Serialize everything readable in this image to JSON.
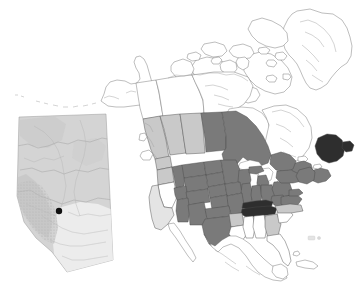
{
  "figure": {
    "width": 364,
    "height": 301,
    "background_color": "#ffffff"
  },
  "legend_colors": {
    "highlight_dark": "#7a7a7a",
    "highlight_darkest": "#2e2e2e",
    "highlight_light": "#c9c9c9",
    "highlight_very_light": "#e2e2e2",
    "unshaded": "#ffffff",
    "border": "#4a4a4a",
    "marker": "#111111"
  },
  "main_map": {
    "name": "north-america-choropleth",
    "projection_note": "Lambert conformal style, North America",
    "shade_classes": [
      {
        "key": "darkest",
        "color": "#2e2e2e",
        "label": "darkest shading"
      },
      {
        "key": "dark",
        "color": "#7a7a7a",
        "label": "dark shading"
      },
      {
        "key": "light",
        "color": "#c9c9c9",
        "label": "light shading"
      },
      {
        "key": "very_light",
        "color": "#e4e4e4",
        "label": "very light shading"
      },
      {
        "key": "none",
        "color": "#ffffff",
        "label": "no shading"
      }
    ],
    "regions": [
      {
        "name": "alaska",
        "shade": "none"
      },
      {
        "name": "yukon",
        "shade": "none"
      },
      {
        "name": "northwest-territories",
        "shade": "none"
      },
      {
        "name": "nunavut",
        "shade": "none"
      },
      {
        "name": "greenland",
        "shade": "none"
      },
      {
        "name": "british-columbia",
        "shade": "light"
      },
      {
        "name": "alberta",
        "shade": "light"
      },
      {
        "name": "saskatchewan",
        "shade": "light"
      },
      {
        "name": "manitoba",
        "shade": "dark"
      },
      {
        "name": "ontario",
        "shade": "dark"
      },
      {
        "name": "quebec",
        "shade": "none"
      },
      {
        "name": "newfoundland-labrador",
        "shade": "darkest"
      },
      {
        "name": "new-brunswick",
        "shade": "dark"
      },
      {
        "name": "nova-scotia",
        "shade": "dark"
      },
      {
        "name": "washington",
        "shade": "light"
      },
      {
        "name": "oregon",
        "shade": "light"
      },
      {
        "name": "idaho",
        "shade": "dark"
      },
      {
        "name": "montana",
        "shade": "dark"
      },
      {
        "name": "north-dakota",
        "shade": "dark"
      },
      {
        "name": "south-dakota",
        "shade": "dark"
      },
      {
        "name": "minnesota",
        "shade": "dark"
      },
      {
        "name": "wisconsin",
        "shade": "dark"
      },
      {
        "name": "michigan",
        "shade": "dark"
      },
      {
        "name": "wyoming",
        "shade": "dark"
      },
      {
        "name": "nebraska",
        "shade": "dark"
      },
      {
        "name": "iowa",
        "shade": "dark"
      },
      {
        "name": "illinois",
        "shade": "dark"
      },
      {
        "name": "indiana",
        "shade": "dark"
      },
      {
        "name": "ohio",
        "shade": "dark"
      },
      {
        "name": "pennsylvania",
        "shade": "dark"
      },
      {
        "name": "new-york",
        "shade": "dark"
      },
      {
        "name": "new-england",
        "shade": "dark"
      },
      {
        "name": "utah",
        "shade": "dark"
      },
      {
        "name": "colorado",
        "shade": "dark"
      },
      {
        "name": "kansas",
        "shade": "dark"
      },
      {
        "name": "missouri",
        "shade": "dark"
      },
      {
        "name": "kentucky",
        "shade": "darkest"
      },
      {
        "name": "tennessee",
        "shade": "darkest"
      },
      {
        "name": "west-virginia",
        "shade": "dark"
      },
      {
        "name": "virginia",
        "shade": "dark"
      },
      {
        "name": "maryland",
        "shade": "dark"
      },
      {
        "name": "nevada",
        "shade": "none"
      },
      {
        "name": "california",
        "shade": "very_light"
      },
      {
        "name": "arizona",
        "shade": "dark"
      },
      {
        "name": "new-mexico",
        "shade": "dark"
      },
      {
        "name": "oklahoma",
        "shade": "dark"
      },
      {
        "name": "texas",
        "shade": "dark"
      },
      {
        "name": "arkansas",
        "shade": "light"
      },
      {
        "name": "louisiana",
        "shade": "none"
      },
      {
        "name": "mississippi",
        "shade": "none"
      },
      {
        "name": "alabama",
        "shade": "none"
      },
      {
        "name": "georgia",
        "shade": "light"
      },
      {
        "name": "south-carolina",
        "shade": "none"
      },
      {
        "name": "north-carolina",
        "shade": "light"
      },
      {
        "name": "florida",
        "shade": "none"
      },
      {
        "name": "mexico",
        "shade": "none"
      },
      {
        "name": "cuba",
        "shade": "none"
      },
      {
        "name": "bermuda-islet",
        "shade": "very_light"
      }
    ]
  },
  "inset_map": {
    "name": "alberta-inset",
    "region_label": "Alberta",
    "fill_color": "#d4d4d4",
    "border_color": "#9a9a9a",
    "marker": {
      "name": "study-site-marker",
      "shape": "filled-circle",
      "color": "#111111",
      "x": 45,
      "y": 99,
      "radius": 3.2
    }
  }
}
